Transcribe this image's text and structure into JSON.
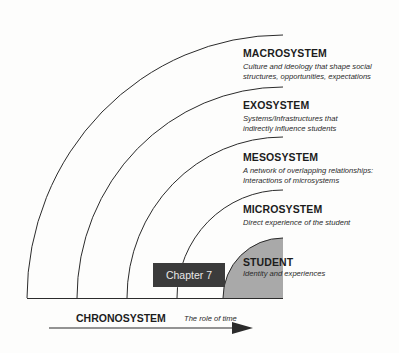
{
  "diagram": {
    "layers": [
      {
        "id": "macrosystem",
        "title": "MACROSYSTEM",
        "description_line1": "Culture and ideology that shape social",
        "description_line2": "structures, opportunities, expectations"
      },
      {
        "id": "exosystem",
        "title": "EXOSYSTEM",
        "description_line1": "Systems/Infrastructures that",
        "description_line2": "indirectly influence students"
      },
      {
        "id": "mesosystem",
        "title": "MESOSYSTEM",
        "description_line1": "A network of overlapping relationships:",
        "description_line2": "Interactions of microsystems"
      },
      {
        "id": "microsystem",
        "title": "MICROSYSTEM",
        "description_line1": "Direct experience of the student",
        "description_line2": ""
      },
      {
        "id": "student",
        "title": "STUDENT",
        "description_line1": "Identity and experiences",
        "description_line2": ""
      }
    ],
    "chapter_label": "Chapter 7",
    "chronosystem": {
      "title": "CHRONOSYSTEM",
      "description": "The role of time"
    },
    "colors": {
      "student_fill": "#a9a9a9",
      "chapter_box": "#3b3b3b",
      "line": "#2b2b2b"
    }
  }
}
